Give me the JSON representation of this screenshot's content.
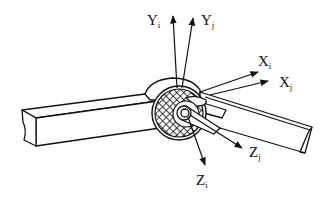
{
  "diagram": {
    "colors": {
      "stroke": "#111111",
      "background": "#ffffff"
    },
    "axes": [
      {
        "id": "Yi",
        "letter": "Y",
        "subscript": "i"
      },
      {
        "id": "Yj",
        "letter": "Y",
        "subscript": "j"
      },
      {
        "id": "Xi",
        "letter": "X",
        "subscript": "i"
      },
      {
        "id": "Xj",
        "letter": "X",
        "subscript": "j"
      },
      {
        "id": "Zi",
        "letter": "Z",
        "subscript": "i"
      },
      {
        "id": "Zj",
        "letter": "Z",
        "subscript": "j"
      }
    ],
    "components": [
      "link-i",
      "link-j",
      "joint-bearing",
      "joint-pin"
    ]
  }
}
